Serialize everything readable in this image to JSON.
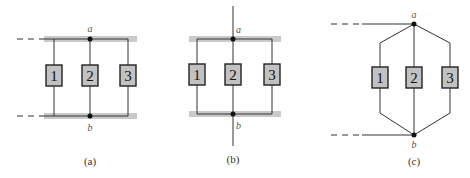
{
  "panels": [
    {
      "id": "a",
      "caption": "(a)",
      "node_top": "a",
      "node_bottom": "b",
      "elements": [
        "1",
        "2",
        "3"
      ]
    },
    {
      "id": "b",
      "caption": "(b)",
      "node_top": "a",
      "node_bottom": "b",
      "elements": [
        "1",
        "2",
        "3"
      ]
    },
    {
      "id": "c",
      "caption": "(c)",
      "node_top": "a",
      "node_bottom": "b",
      "elements": [
        "1",
        "2",
        "3"
      ]
    }
  ],
  "colors": {
    "rail": "#c9c9c9",
    "box_fill": "#c2c2c2",
    "wire": "#333333"
  }
}
